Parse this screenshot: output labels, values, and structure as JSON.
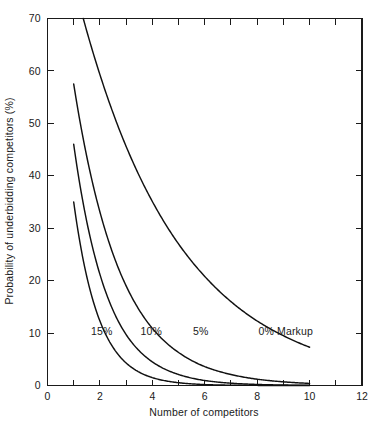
{
  "chart_data": {
    "type": "line",
    "title": "",
    "xlabel": "Number of competitors",
    "ylabel": "Probability of underbidding competitors (%)",
    "xlim": [
      0,
      12
    ],
    "ylim": [
      0,
      70
    ],
    "xticks": [
      0,
      1,
      2,
      3,
      4,
      5,
      6,
      7,
      8,
      9,
      10,
      11,
      12
    ],
    "xtick_labels": [
      "0",
      "",
      "2",
      "",
      "4",
      "",
      "6",
      "",
      "8",
      "",
      "10",
      "",
      "12"
    ],
    "yticks": [
      0,
      10,
      20,
      30,
      40,
      50,
      60,
      70
    ],
    "ytick_labels": [
      "0",
      "10",
      "20",
      "30",
      "40",
      "50",
      "60",
      "70"
    ],
    "grid": false,
    "legend_position": "inline-annotations",
    "frame": "box",
    "x": [
      1,
      2,
      3,
      4,
      5,
      6,
      7,
      8,
      9,
      10
    ],
    "series": [
      {
        "name": "0% Markup",
        "label": "0% Markup",
        "values": [
          77.0,
          59.3,
          45.6,
          35.1,
          27.0,
          20.8,
          16.0,
          12.3,
          9.5,
          7.3
        ],
        "label_x": 8.05,
        "label_y": 9.6
      },
      {
        "name": "5%",
        "label": "5%",
        "values": [
          57.5,
          33.1,
          19.0,
          10.9,
          6.3,
          3.6,
          2.1,
          1.2,
          0.7,
          0.4
        ],
        "label_x": 5.55,
        "label_y": 9.6
      },
      {
        "name": "10%",
        "label": "10%",
        "values": [
          46.0,
          21.2,
          9.7,
          4.5,
          2.1,
          0.95,
          0.44,
          0.2,
          0.09,
          0.04
        ],
        "label_x": 3.55,
        "label_y": 9.6
      },
      {
        "name": "15%",
        "label": "15%",
        "values": [
          35.0,
          12.3,
          4.3,
          1.5,
          0.53,
          0.18,
          0.06,
          0.02,
          0.01,
          0.0
        ],
        "label_x": 1.66,
        "label_y": 9.6
      }
    ],
    "colors": {
      "curve": "#111111",
      "axis": "#1a1a1a",
      "background": "#ffffff"
    }
  }
}
